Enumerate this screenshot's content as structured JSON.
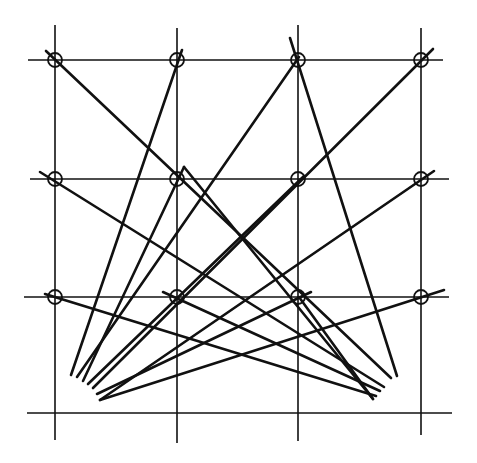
{
  "diagram": {
    "colors": {
      "ink": "#111111",
      "background": "#ffffff"
    },
    "grid": {
      "verticals": [
        {
          "x": 55,
          "y1": 25,
          "y2": 440
        },
        {
          "x": 177,
          "y1": 28,
          "y2": 443
        },
        {
          "x": 298,
          "y1": 25,
          "y2": 441
        },
        {
          "x": 421,
          "y1": 28,
          "y2": 435
        }
      ],
      "horizontals": [
        {
          "y": 60,
          "x1": 28,
          "x2": 443
        },
        {
          "y": 179,
          "x1": 30,
          "x2": 449
        },
        {
          "y": 297,
          "x1": 24,
          "x2": 449
        },
        {
          "y": 413,
          "x1": 27,
          "x2": 452
        }
      ]
    },
    "nodes": [
      {
        "x": 55,
        "y": 60
      },
      {
        "x": 177,
        "y": 60
      },
      {
        "x": 298,
        "y": 60
      },
      {
        "x": 421,
        "y": 60
      },
      {
        "x": 55,
        "y": 179
      },
      {
        "x": 177,
        "y": 179
      },
      {
        "x": 298,
        "y": 179
      },
      {
        "x": 421,
        "y": 179
      },
      {
        "x": 55,
        "y": 297
      },
      {
        "x": 177,
        "y": 297
      },
      {
        "x": 298,
        "y": 297
      },
      {
        "x": 421,
        "y": 297
      }
    ],
    "node_radius": 7,
    "rays": [
      {
        "x1": 71,
        "y1": 375,
        "x2": 182,
        "y2": 50
      },
      {
        "x1": 77,
        "y1": 377,
        "x2": 299,
        "y2": 57
      },
      {
        "x1": 83,
        "y1": 381,
        "x2": 184,
        "y2": 167
      },
      {
        "x1": 88,
        "y1": 384,
        "x2": 304,
        "y2": 176
      },
      {
        "x1": 93,
        "y1": 388,
        "x2": 433,
        "y2": 49
      },
      {
        "x1": 97,
        "y1": 394,
        "x2": 311,
        "y2": 292
      },
      {
        "x1": 100,
        "y1": 400,
        "x2": 434,
        "y2": 171
      },
      {
        "x1": 100,
        "y1": 400,
        "x2": 444,
        "y2": 290
      },
      {
        "x1": 397,
        "y1": 376,
        "x2": 290,
        "y2": 38
      },
      {
        "x1": 391,
        "y1": 378,
        "x2": 46,
        "y2": 51
      },
      {
        "x1": 384,
        "y1": 387,
        "x2": 40,
        "y2": 172
      },
      {
        "x1": 380,
        "y1": 391,
        "x2": 163,
        "y2": 292
      },
      {
        "x1": 376,
        "y1": 396,
        "x2": 45,
        "y2": 294
      },
      {
        "x1": 373,
        "y1": 399,
        "x2": 299,
        "y2": 297
      },
      {
        "x1": 373,
        "y1": 399,
        "x2": 184,
        "y2": 167
      }
    ]
  }
}
